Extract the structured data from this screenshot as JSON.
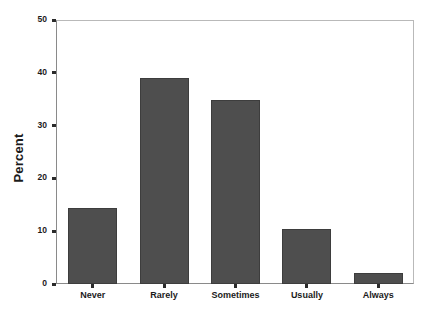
{
  "chart_data": {
    "type": "bar",
    "title": "",
    "subtitle": "",
    "xlabel": "",
    "ylabel": "Percent",
    "categories": [
      "Never",
      "Rarely",
      "Sometimes",
      "Usually",
      "Always"
    ],
    "values": [
      14.4,
      39.0,
      34.8,
      10.5,
      2.1
    ],
    "ylim": [
      0,
      50
    ],
    "yticks": [
      0,
      10,
      20,
      30,
      40,
      50
    ],
    "ytick_labels": [
      "0",
      "10",
      "20",
      "30",
      "40",
      "50"
    ],
    "grid": false,
    "legend": null,
    "legend_position": "none",
    "bar_color": "#4e4e4e",
    "bar_edge_color": "#3d3d3d",
    "axis_color": "#8a8a8a",
    "frame_color": "#b9b9b9",
    "text_color": "#1b1b1b",
    "background_color": "#ffffff"
  }
}
